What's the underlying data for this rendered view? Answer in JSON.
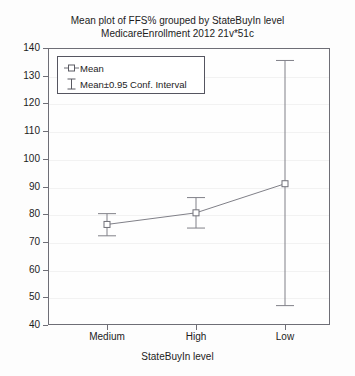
{
  "chart_data": {
    "type": "line",
    "title": "Mean plot of FFS% grouped by StateBuyIn level",
    "subtitle": "MedicareEnrollment 2012 21v*51c",
    "xlabel": "StateBuyIn level",
    "ylabel": "FFS%",
    "categories": [
      "Medium",
      "High",
      "Low"
    ],
    "ylim": [
      40,
      140
    ],
    "yticks": [
      40,
      50,
      60,
      70,
      80,
      90,
      100,
      110,
      120,
      130,
      140
    ],
    "grid": true,
    "legend_position": "upper-left",
    "series": [
      {
        "name": "Mean",
        "values": [
          76.3,
          80.5,
          91.0
        ],
        "ci_lower": [
          72.2,
          75.0,
          47.0
        ],
        "ci_upper": [
          80.2,
          86.0,
          135.5
        ],
        "ci_label": "Mean±0.95 Conf. Interval"
      }
    ],
    "legend": [
      {
        "label": "Mean",
        "glyph": "square-marker"
      },
      {
        "label": "Mean±0.95 Conf. Interval",
        "glyph": "error-bar-marker"
      }
    ],
    "colors": {
      "line": "#808088",
      "marker": "#707078",
      "error_bar": "#808088",
      "axis": "#6e6e76",
      "grid": "#f2f2f2",
      "background": "#fdfdfd",
      "text": "#1c1c1c"
    }
  }
}
